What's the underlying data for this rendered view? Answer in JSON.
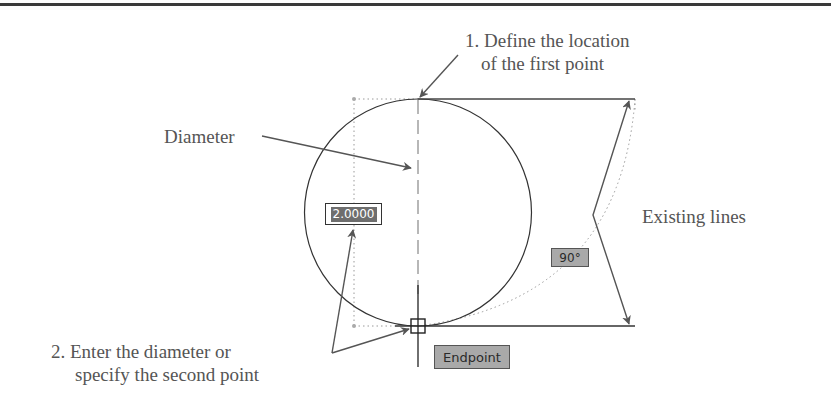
{
  "diagram": {
    "annotations": {
      "step1_line1": "1. Define the location",
      "step1_line2": "of the first point",
      "diameter": "Diameter",
      "existing_lines": "Existing lines",
      "step2_line1": "2. Enter the diameter or",
      "step2_line2": "specify the second point"
    },
    "tooltips": {
      "diameter_input": "2.0000",
      "angle": "90°",
      "osnap": "Endpoint"
    },
    "colors": {
      "line": "#333333",
      "text": "#555555",
      "arrow": "#555555",
      "tooltip_gray": "#a9a9a9",
      "highlight": "#6e6e6e"
    }
  }
}
